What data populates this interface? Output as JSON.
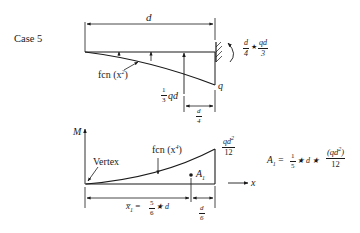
{
  "case_label": "Case 5",
  "top": {
    "span_label": "d",
    "curve_label": "fcn (x",
    "curve_exp": "2",
    "curve_close": ")",
    "resultant_coef_num": "1",
    "resultant_coef_den": "3",
    "resultant_tail": "qd",
    "offset_num": "d",
    "offset_den": "4",
    "load_end_label": "q",
    "moment_num1": "d",
    "moment_den1": "4",
    "moment_star": "★",
    "moment_num2": "qd",
    "moment_den2": "3"
  },
  "bottom": {
    "axis_y_label": "M",
    "axis_x_label": "x",
    "vertex_label": "Vertex",
    "curve_label": "fcn (x",
    "curve_exp": "4",
    "curve_close": ")",
    "peak_num": "qd",
    "peak_exp": "2",
    "peak_den": "12",
    "centroid_label": "A",
    "centroid_sub": "1",
    "xbar_label": "x̅",
    "xbar_sub": "1",
    "xbar_eq": "=",
    "xbar_num": "5",
    "xbar_den": "6",
    "xbar_tail": "★ d",
    "offset_num": "d",
    "offset_den": "6"
  },
  "formula": {
    "lhs": "A",
    "lhs_sub": "1",
    "eq": "=",
    "c_num": "1",
    "c_den": "5",
    "mid": "★ d ★",
    "f_num": "(qd",
    "f_exp": "2",
    "f_close": ")",
    "f_den": "12"
  }
}
